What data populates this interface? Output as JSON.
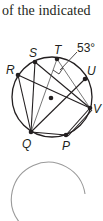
{
  "caption": "of the indicated",
  "figure": {
    "points": {
      "R": {
        "label": "R",
        "x": 18,
        "y": 75
      },
      "S": {
        "label": "S",
        "x": 35,
        "y": 62
      },
      "T": {
        "label": "T",
        "x": 57,
        "y": 59
      },
      "U": {
        "label": "U",
        "x": 85,
        "y": 79
      },
      "V": {
        "label": "V",
        "x": 90,
        "y": 108
      },
      "P": {
        "label": "P",
        "x": 66,
        "y": 135
      },
      "Q": {
        "label": "Q",
        "x": 31,
        "y": 132
      }
    },
    "center": {
      "x": 51,
      "y": 98
    },
    "angle_label": "53°",
    "colors": {
      "ink": "#231f20",
      "ghost_circle": "#9a9a9a"
    }
  }
}
